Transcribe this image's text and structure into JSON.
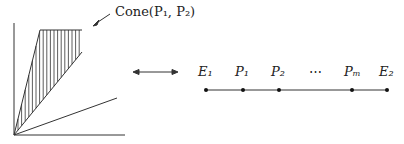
{
  "cone_label": "Cone(P₁, P₂)",
  "sequence": {
    "points": [
      {
        "label": "E₁",
        "x": 206
      },
      {
        "label": "P₁",
        "x": 243
      },
      {
        "label": "P₂",
        "x": 279
      },
      {
        "label": "Pₘ",
        "x": 352
      },
      {
        "label": "E₂",
        "x": 387
      }
    ],
    "ellipsis": "⋯"
  },
  "arrow": "double-arrow"
}
